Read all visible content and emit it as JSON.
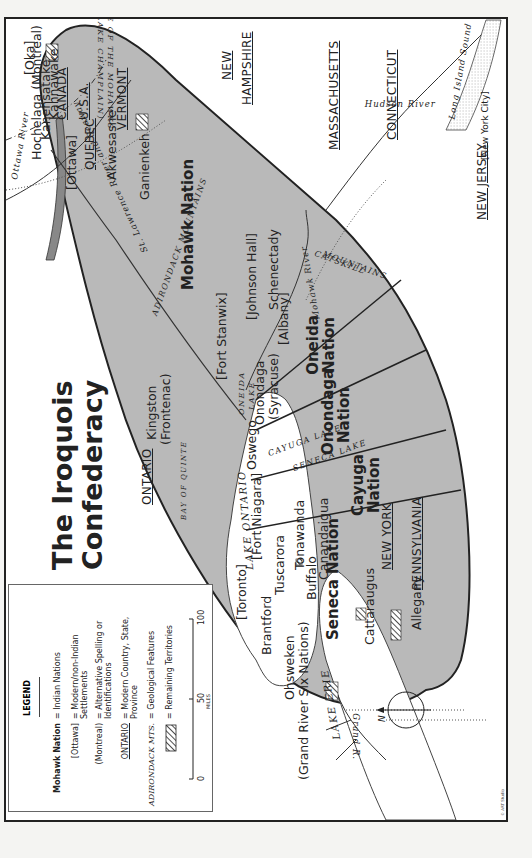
{
  "title": {
    "line1": "The Iroquois",
    "line2": "Confederacy"
  },
  "legend": {
    "heading": "LEGEND",
    "entries": [
      {
        "key": "Mohawk Nation",
        "value": "= Indian Nations",
        "style": "bold"
      },
      {
        "key": "[Ottawa]",
        "value": "= Modern/non-Indian Settlements",
        "style": "normal"
      },
      {
        "key": "(Montreal)",
        "value": "= Alternative Spelling or Identifications",
        "style": "normal"
      },
      {
        "key": "ONTARIO",
        "value": "= Modern Country, State, Province",
        "style": "underline"
      },
      {
        "key": "ADIRONDACK MTS.",
        "value": "= Geological Features",
        "style": "italic"
      },
      {
        "key": "hatched-box",
        "value": "= Remaining Territories",
        "style": "pattern"
      }
    ],
    "scale": {
      "ticks": [
        "0",
        "50",
        "100"
      ],
      "unit": "MILES"
    }
  },
  "nations": [
    {
      "name": "Mohawk",
      "label": "Mohawk Nation"
    },
    {
      "name": "Oneida",
      "label": "Oneida Nation"
    },
    {
      "name": "Onondaga",
      "label": "Onondaga Nation"
    },
    {
      "name": "Cayuga",
      "label": "Cayuga Nation"
    },
    {
      "name": "Seneca",
      "label": "Seneca Nation"
    }
  ],
  "settlements": {
    "hochelaga": "Hochelaga (Montreal)",
    "kahnawake": "Kahnawake",
    "oka": "[Oka]",
    "kanehsatake": "Kanehsatake",
    "ottawa": "[Ottawa]",
    "akwesasne": "Akwesasne",
    "ganienkeh": "Ganienkeh",
    "johnson_hall": "[Johnson Hall]",
    "schenectady": "Schenectady",
    "albany": "[Albany]",
    "fort_stanwix": "[Fort Stanwix]",
    "onondaga": "Onondaga",
    "syracuse": "(Syracuse)",
    "oswego": "Oswego",
    "kingston": "Kingston",
    "frontenac": "(Frontenac)",
    "fort_niagara": "[Fort Niagara]",
    "tuscarora": "Tuscarora",
    "tonawanda": "Tonawanda",
    "buffalo": "Buffalo",
    "canandaigua": "Canandaigua",
    "cattaraugus": "Cattaraugus",
    "allegany": "Allegany",
    "toronto": "[Toronto]",
    "brantford": "Brantford",
    "ohsweken": "Ohsweken",
    "grand_river": "(Grand River Six Nations)",
    "new_york_city": "[New York City]"
  },
  "regions": {
    "canada": "CANADA",
    "usa": "U.S.A.",
    "vermont": "VERMONT",
    "new_hampshire_1": "NEW",
    "new_hampshire_2": "HAMPSHIRE",
    "massachusetts": "MASSACHUSETTS",
    "connecticut": "CONNECTICUT",
    "new_jersey": "NEW JERSEY",
    "quebec": "QUEBEC",
    "ontario": "ONTARIO",
    "new_york": "NEW YORK",
    "pennsylvania": "PENNSYLVANIA"
  },
  "features": {
    "lake_mohawks_1": "LAKE OF THE MOHAWKS",
    "lake_mohawks_2": "(LAKE CHAMPLAIN)",
    "adirondack": "ADIRONDACK MOUNTAINS",
    "catskill_1": "CATSKILL",
    "catskill_2": "MOUNTAINS",
    "oneida_lake_1": "ONEIDA",
    "oneida_lake_2": "LAKE",
    "cayuga_lake": "CAYUGA LAKE",
    "seneca_lake": "SENECA LAKE",
    "lake_ontario": "LAKE ONTARIO",
    "lake_erie": "LAKE ERIE",
    "bay_of_quinte": "BAY OF QUINTE",
    "ottawa_river": "Ottawa River",
    "st_lawrence": "St. Lawrence River and Seaway",
    "mohawk_river": "Mohawk River",
    "hudson_river": "Hudson River",
    "grand_river": "Grand R.",
    "long_island_sound": "Long Island Sound"
  },
  "compass": {
    "label": "N"
  },
  "credit": "© ART Studio",
  "colors": {
    "territory": "#b9b9b9",
    "water": "#ffffff",
    "land": "#ffffff",
    "ink": "#222222"
  }
}
